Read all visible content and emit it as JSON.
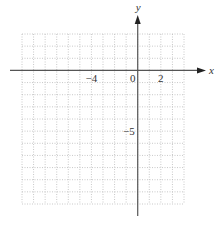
{
  "chart_data": {
    "type": "scatter",
    "title": "",
    "xlabel": "x",
    "ylabel": "y",
    "xlim": [
      -10,
      4
    ],
    "ylim": [
      -11,
      3
    ],
    "grid": true,
    "grid_style": "dotted",
    "x_tick_labels": [
      {
        "value": -4,
        "label": "−4"
      },
      {
        "value": 0,
        "label": "0"
      },
      {
        "value": 2,
        "label": "2"
      }
    ],
    "y_tick_labels": [
      {
        "value": -5,
        "label": "−5"
      }
    ],
    "series": []
  },
  "colors": {
    "axis": "#555555",
    "grid": "#bbbbbb",
    "text": "#333333"
  }
}
